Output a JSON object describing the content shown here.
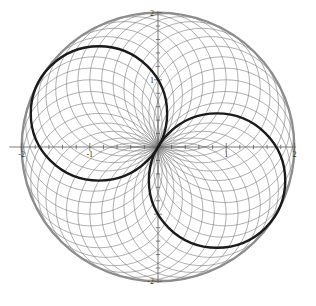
{
  "figure": {
    "title": "",
    "background_color": "#ffffff",
    "width": 316,
    "height": 306
  },
  "axes": {
    "origin_px": {
      "x": 158,
      "y": 147
    },
    "unit_px": {
      "x": 68.2,
      "y": 67.2
    },
    "axis_color": "#5a5a5a",
    "axis_line_width": 0.8,
    "x_range": [
      -2.18,
      2.02
    ],
    "y_range": [
      -2.02,
      2.02
    ],
    "major_tick_step": 1,
    "minor_tick_step": 0.2,
    "x_tick_labels": [
      {
        "value": -2,
        "text": "-2"
      },
      {
        "value": -1,
        "text": "-1"
      },
      {
        "value": 1,
        "text": "1"
      },
      {
        "value": 2,
        "text": "2"
      }
    ],
    "y_tick_labels": [
      {
        "value": 2,
        "text": "2"
      },
      {
        "value": 1,
        "text": "1"
      },
      {
        "value": -2,
        "text": "-2"
      }
    ],
    "xlabel": "",
    "ylabel": "",
    "grid": false
  },
  "chart_data": {
    "type": "line",
    "title": "",
    "xlabel": "",
    "ylabel": "",
    "xlim": [
      -2.18,
      2.02
    ],
    "ylim": [
      -2.02,
      2.02
    ],
    "grid": false,
    "legend": null,
    "series": [
      {
        "name": "circle-family",
        "kind": "circle-pencil",
        "count": 36,
        "radius": 1,
        "center_radius": 1,
        "center_angles_deg": [
          0,
          10,
          20,
          30,
          40,
          50,
          60,
          70,
          80,
          90,
          100,
          110,
          120,
          130,
          140,
          150,
          160,
          170,
          180,
          190,
          200,
          210,
          220,
          230,
          240,
          250,
          260,
          270,
          280,
          290,
          300,
          310,
          320,
          330,
          340,
          350
        ],
        "color": "#7a7a7a",
        "line_width": 0.6
      },
      {
        "name": "envelope-circle",
        "kind": "circle",
        "center": [
          0,
          0
        ],
        "radius": 2,
        "color": "#8c8c8c",
        "line_width": 2.2
      },
      {
        "name": "highlight-circle-a",
        "kind": "circle",
        "center_angle_deg": 150,
        "center": [
          -0.866,
          0.5
        ],
        "radius": 1,
        "color": "#1a1a1a",
        "line_width": 2.4
      },
      {
        "name": "highlight-circle-b",
        "kind": "circle",
        "center_angle_deg": 330,
        "center": [
          0.866,
          -0.5
        ],
        "radius": 1,
        "color": "#1a1a1a",
        "line_width": 2.4
      }
    ]
  },
  "colors": {
    "family_line": "#7a7a7a",
    "envelope": "#8c8c8c",
    "highlight": "#1a1a1a",
    "axis": "#5a5a5a",
    "tick_label": "#2b2b2b",
    "background": "#ffffff"
  }
}
